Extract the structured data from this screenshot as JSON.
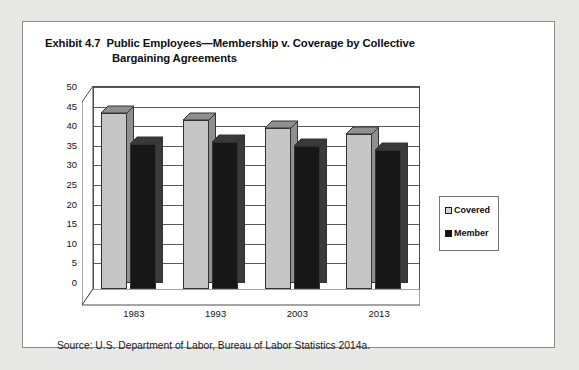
{
  "exhibit": {
    "number": "Exhibit 4.7",
    "title_line1": "Public Employees—Membership v. Coverage by Collective",
    "title_line2": "Bargaining Agreements",
    "source": "Source: U.S. Department of Labor, Bureau of Labor Statistics 2014a."
  },
  "legend": {
    "covered_label": "Covered",
    "member_label": "Member"
  },
  "colors": {
    "covered_front": "#c6c6c6",
    "covered_side": "#8f8f8f",
    "member_front": "#171717",
    "member_side": "#3a3a3a",
    "panel_border": "#8d8d8d",
    "page_background": "#e8e8e6"
  },
  "chart_data": {
    "type": "bar",
    "categories": [
      "1983",
      "1993",
      "2003",
      "2013"
    ],
    "series": [
      {
        "name": "Covered",
        "values": [
          45,
          43,
          41,
          39.5
        ]
      },
      {
        "name": "Member",
        "values": [
          37,
          37.5,
          36.5,
          35.5
        ]
      }
    ],
    "xlabel": "",
    "ylabel": "",
    "ylim": [
      0,
      50
    ],
    "yticks": [
      0,
      5,
      10,
      15,
      20,
      25,
      30,
      35,
      40,
      45,
      50
    ],
    "ytick_labels": [
      "0",
      "5",
      "10",
      "15",
      "20",
      "25",
      "30",
      "35",
      "40",
      "45",
      "50"
    ],
    "grid": true,
    "legend_position": "right",
    "style": "3d-column"
  }
}
